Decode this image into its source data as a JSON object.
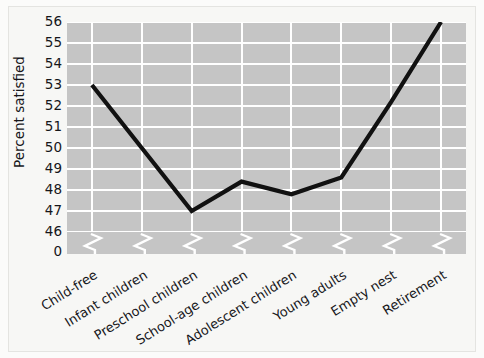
{
  "chart_data": {
    "type": "line",
    "title": "",
    "xlabel": "",
    "ylabel": "Percent satisfied",
    "categories": [
      "Child-free",
      "Infant children",
      "Preschool children",
      "School-age children",
      "Adolescent children",
      "Young adults",
      "Empty nest",
      "Retirement"
    ],
    "values": [
      53.0,
      50.0,
      47.0,
      48.4,
      47.8,
      48.6,
      52.2,
      56.0
    ],
    "ylim": [
      46,
      56
    ],
    "yticks": [
      56,
      55,
      54,
      53,
      52,
      51,
      50,
      49,
      48,
      47,
      46
    ],
    "axis_break_tick": "0",
    "grid": true,
    "legend": "none",
    "series": [
      {
        "name": "Percent satisfied",
        "values": [
          53.0,
          50.0,
          47.0,
          48.4,
          47.8,
          48.6,
          52.2,
          56.0
        ]
      }
    ]
  },
  "colors": {
    "plot_background": "#c5c5c5",
    "gridline": "#ffffff",
    "series_line": "#111111",
    "page_background": "#f7f7f5",
    "text": "#16161a"
  }
}
